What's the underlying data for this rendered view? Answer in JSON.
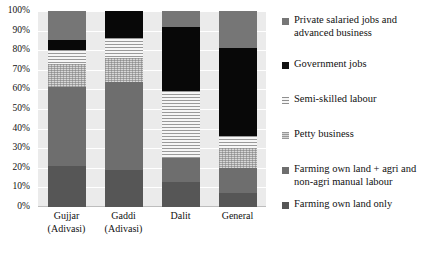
{
  "chart_data": {
    "type": "bar",
    "title": "",
    "subtitle": "",
    "xlabel": "",
    "ylabel": "",
    "stacked": true,
    "normalized_percent": true,
    "grid": true,
    "legend_position": "right",
    "ylim": [
      0,
      100
    ],
    "y_ticks": [
      "0%",
      "10%",
      "20%",
      "30%",
      "40%",
      "50%",
      "60%",
      "70%",
      "80%",
      "90%",
      "100%"
    ],
    "y_tick_values": [
      0,
      10,
      20,
      30,
      40,
      50,
      60,
      70,
      80,
      90,
      100
    ],
    "categories": [
      "Gujjar (Adivasi)",
      "Gaddi (Adivasi)",
      "Dalit",
      "General"
    ],
    "category_lines": [
      [
        "Gujjar",
        "(Adivasi)"
      ],
      [
        "Gaddi",
        "(Adivasi)"
      ],
      [
        "Dalit",
        ""
      ],
      [
        "General",
        ""
      ]
    ],
    "series": [
      {
        "name": "Farming own land only",
        "key": "farmonly",
        "color": "#565656",
        "values": [
          21,
          19,
          13,
          7
        ]
      },
      {
        "name": "Farming own land + agri and non-agri manual labour",
        "key": "farmlabour",
        "color": "#6e6e6e",
        "values": [
          40,
          45,
          12,
          13
        ]
      },
      {
        "name": "Petty business",
        "key": "petty",
        "color": "#d8d8d8",
        "values": [
          12,
          12,
          0,
          10
        ]
      },
      {
        "name": "Semi-skilled labour",
        "key": "semiskilled",
        "color": "#f4f4f4",
        "values": [
          7,
          10,
          34,
          6
        ]
      },
      {
        "name": "Government jobs",
        "key": "government",
        "color": "#080808",
        "values": [
          5,
          14,
          33,
          45
        ]
      },
      {
        "name": "Private salaried jobs and advanced business",
        "key": "private",
        "color": "#767676",
        "values": [
          15,
          0,
          8,
          19
        ]
      }
    ]
  },
  "legend": {
    "items": [
      {
        "label_line1": "Private salaried jobs and",
        "label_line2": "advanced business",
        "key": "private"
      },
      {
        "label_line1": "Government jobs",
        "label_line2": "",
        "key": "government"
      },
      {
        "label_line1": "Semi-skilled labour",
        "label_line2": "",
        "key": "semiskilled"
      },
      {
        "label_line1": "Petty business",
        "label_line2": "",
        "key": "petty"
      },
      {
        "label_line1": "Farming own land + agri and",
        "label_line2": "non-agri manual labour",
        "key": "farmlabour"
      },
      {
        "label_line1": "Farming own land only",
        "label_line2": "",
        "key": "farmonly"
      }
    ]
  }
}
